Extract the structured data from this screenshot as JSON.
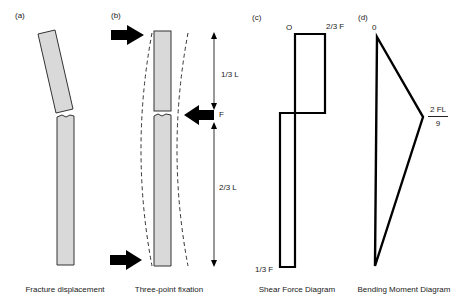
{
  "panels": {
    "a": {
      "label": "(a)",
      "caption": "Fracture displacement"
    },
    "b": {
      "label": "(b)",
      "caption": "Three-point fixation",
      "force_label": "F",
      "upper_segment_label": "1/3 L",
      "lower_segment_label": "2/3 L"
    },
    "c": {
      "label": "(c)",
      "caption": "Shear Force Diagram",
      "origin_label": "O",
      "top_value_label": "2/3 F",
      "bottom_value_label": "1/3 F"
    },
    "d": {
      "label": "(d)",
      "caption": "Bending Moment Diagram",
      "origin_label": "0",
      "peak_numerator": "2 FL",
      "peak_denominator": "9"
    }
  },
  "colors": {
    "bone_fill": "#d9d9d9",
    "outline": "#111111",
    "dashed": "#333333"
  }
}
